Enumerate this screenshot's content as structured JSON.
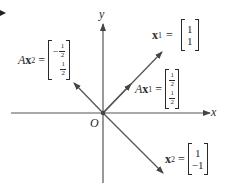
{
  "diagram": {
    "axes": {
      "x_label": "x",
      "y_label": "y",
      "origin_label": "O"
    },
    "vectors": [
      {
        "id": "x1",
        "label_prefix": "",
        "label_bold": "x",
        "label_sub": "1",
        "values": [
          "1",
          "1"
        ]
      },
      {
        "id": "Ax1",
        "label_prefix": "A",
        "label_bold": "x",
        "label_sub": "1",
        "values": [
          "1/2",
          "1/2"
        ],
        "fractions": [
          {
            "sign": "",
            "num": "1",
            "den": "2"
          },
          {
            "sign": "",
            "num": "1",
            "den": "2"
          }
        ]
      },
      {
        "id": "x2",
        "label_prefix": "",
        "label_bold": "x",
        "label_sub": "2",
        "values": [
          "1",
          "-1"
        ]
      },
      {
        "id": "Ax2",
        "label_prefix": "A",
        "label_bold": "x",
        "label_sub": "2",
        "values": [
          "-1/2",
          "1/2"
        ],
        "fractions": [
          {
            "sign": "−",
            "num": "1",
            "den": "2"
          },
          {
            "sign": "",
            "num": "1",
            "den": "2"
          }
        ]
      }
    ],
    "equals": "=",
    "x2_entries": [
      "1",
      "−1"
    ],
    "x1_entries": [
      "1",
      "1"
    ],
    "colors": {
      "line": "#555555",
      "text": "#2a2a2a"
    }
  }
}
